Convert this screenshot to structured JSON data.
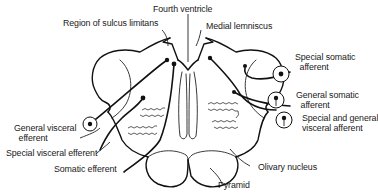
{
  "figure": {
    "stroke_color": "#111111",
    "background": "#ffffff"
  },
  "labels": {
    "fourth_ventricle": "Fourth ventricle",
    "sulcus_limitans": "Region of sulcus limitans",
    "medial_lemniscus": "Medial lemniscus",
    "special_somatic_afferent_1": "Special somatic",
    "special_somatic_afferent_2": "afferent",
    "general_somatic_afferent_1": "General somatic",
    "general_somatic_afferent_2": "afferent",
    "special_general_visceral_afferent_1": "Special and general",
    "special_general_visceral_afferent_2": "visceral afferent",
    "general_visceral_efferent_1": "General visceral",
    "general_visceral_efferent_2": "efferent",
    "special_visceral_efferent": "Special visceral efferent",
    "somatic_efferent": "Somatic efferent",
    "olivary_nucleus": "Olivary nucleus",
    "pyramid": "Pyramid"
  }
}
